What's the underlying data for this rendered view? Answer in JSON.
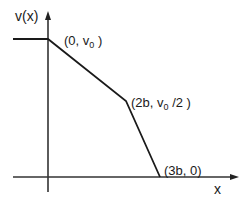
{
  "diagram": {
    "y_axis_label": "v(x)",
    "x_axis_label": "x",
    "points": [
      {
        "label_prefix": "(0, v",
        "label_sub": "0",
        "label_suffix": " )",
        "x": "0",
        "y": "v0"
      },
      {
        "label_prefix": "(2b, v",
        "label_sub": "0",
        "label_suffix": " /2 )",
        "x": "2b",
        "y": "v0/2"
      },
      {
        "label_prefix": "(3b, 0)",
        "label_sub": "",
        "label_suffix": "",
        "x": "3b",
        "y": "0"
      }
    ],
    "colors": {
      "line": "#1a1a1a",
      "axis": "#333333",
      "background": "#ffffff"
    }
  }
}
